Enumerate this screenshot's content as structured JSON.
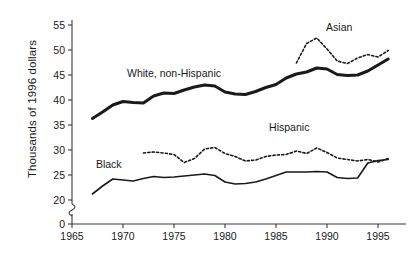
{
  "chart_data": {
    "type": "line",
    "title": "",
    "xlabel": "",
    "ylabel": "Thousands of 1996 dollars",
    "xlim": [
      1965,
      1996.5
    ],
    "ylim": [
      18.5,
      56
    ],
    "grid": false,
    "legend_position": "inline-annotations",
    "axis_break": {
      "present": true,
      "between": [
        0,
        20
      ],
      "axis": "y"
    },
    "xticks": [
      1965,
      1970,
      1975,
      1980,
      1985,
      1990,
      1995
    ],
    "xtick_labels": [
      "1965",
      "1970",
      "1975",
      "1980",
      "1985",
      "1990",
      "1995"
    ],
    "yticks": [
      0,
      20,
      25,
      30,
      35,
      40,
      45,
      50,
      55
    ],
    "ytick_labels": [
      "0",
      "20",
      "25",
      "30",
      "35",
      "40",
      "45",
      "50",
      "55"
    ],
    "series": [
      {
        "name": "White, non-Hispanic",
        "style": "solid",
        "width": "thick",
        "color": "#1a1a1a",
        "label_text": "White, non-Hispanic",
        "label_x": 1975.0,
        "label_y": 44.6,
        "x": [
          1967,
          1968,
          1969,
          1970,
          1971,
          1972,
          1973,
          1974,
          1975,
          1976,
          1977,
          1978,
          1979,
          1980,
          1981,
          1982,
          1983,
          1984,
          1985,
          1986,
          1987,
          1988,
          1989,
          1990,
          1991,
          1992,
          1993,
          1994,
          1995,
          1996
        ],
        "values": [
          36.3,
          37.6,
          39.0,
          39.7,
          39.5,
          39.4,
          40.8,
          41.4,
          41.3,
          42.0,
          42.6,
          43.0,
          42.8,
          41.6,
          41.2,
          41.1,
          41.7,
          42.5,
          43.1,
          44.4,
          45.2,
          45.6,
          46.4,
          46.2,
          45.1,
          44.9,
          45.0,
          45.8,
          47.0,
          48.2
        ]
      },
      {
        "name": "Asian",
        "style": "dotted",
        "width": "medium",
        "color": "#1a1a1a",
        "label_text": "Asian",
        "label_x": 1991.2,
        "label_y": 53.8,
        "x": [
          1987,
          1988,
          1989,
          1990,
          1991,
          1992,
          1993,
          1994,
          1995,
          1996
        ],
        "values": [
          47.4,
          51.3,
          52.4,
          50.2,
          47.8,
          47.3,
          48.4,
          49.1,
          48.6,
          49.9
        ]
      },
      {
        "name": "Hispanic",
        "style": "dotted",
        "width": "medium",
        "color": "#1a1a1a",
        "label_text": "Hispanic",
        "label_x": 1986.3,
        "label_y": 33.9,
        "x": [
          1972,
          1973,
          1974,
          1975,
          1976,
          1977,
          1978,
          1979,
          1980,
          1981,
          1982,
          1983,
          1984,
          1985,
          1986,
          1987,
          1988,
          1989,
          1990,
          1991,
          1992,
          1993,
          1994,
          1995,
          1996
        ],
        "values": [
          29.4,
          29.6,
          29.4,
          29.1,
          27.5,
          28.3,
          30.2,
          30.5,
          29.3,
          28.7,
          27.8,
          28.0,
          28.7,
          29.0,
          29.1,
          29.8,
          29.3,
          30.4,
          29.5,
          28.4,
          28.1,
          27.8,
          28.1,
          27.6,
          28.3
        ]
      },
      {
        "name": "Black",
        "style": "solid",
        "width": "medium",
        "color": "#1a1a1a",
        "label_text": "Black",
        "label_x": 1968.6,
        "label_y": 26.4,
        "x": [
          1967,
          1968,
          1969,
          1970,
          1971,
          1972,
          1973,
          1974,
          1975,
          1976,
          1977,
          1978,
          1979,
          1980,
          1981,
          1982,
          1983,
          1984,
          1985,
          1986,
          1987,
          1988,
          1989,
          1990,
          1991,
          1992,
          1993,
          1994,
          1995,
          1996
        ],
        "values": [
          21.2,
          22.8,
          24.2,
          24.0,
          23.8,
          24.3,
          24.7,
          24.5,
          24.6,
          24.8,
          25.0,
          25.2,
          24.9,
          23.6,
          23.2,
          23.3,
          23.6,
          24.2,
          24.9,
          25.6,
          25.6,
          25.6,
          25.7,
          25.6,
          24.5,
          24.3,
          24.4,
          27.4,
          27.9,
          28.1
        ]
      }
    ]
  }
}
